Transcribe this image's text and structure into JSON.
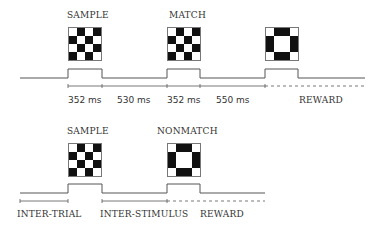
{
  "trial_match": {
    "labels": {
      "sample": "SAMPLE",
      "match": "MATCH"
    },
    "stimuli": {
      "sample_pattern": "checkerboard",
      "match_pattern": "checkerboard",
      "third_pattern": "ring"
    },
    "timeline": {
      "durations": [
        "352 ms",
        "530 ms",
        "352 ms",
        "550 ms"
      ],
      "reward": "REWARD"
    }
  },
  "trial_nonmatch": {
    "labels": {
      "sample": "SAMPLE",
      "nonmatch": "NONMATCH"
    },
    "stimuli": {
      "sample_pattern": "checkerboard",
      "nonmatch_pattern": "ring"
    },
    "timeline": {
      "inter_trial": "INTER-TRIAL",
      "inter_stimulus": "INTER-STIMULUS",
      "reward": "REWARD"
    }
  },
  "patterns": {
    "checkerboard": [
      [
        0,
        1,
        0,
        1
      ],
      [
        1,
        0,
        1,
        0
      ],
      [
        0,
        1,
        0,
        1
      ],
      [
        1,
        0,
        1,
        0
      ]
    ],
    "ring": [
      [
        0,
        1,
        1,
        0
      ],
      [
        1,
        0,
        0,
        1
      ],
      [
        1,
        0,
        0,
        1
      ],
      [
        0,
        1,
        1,
        0
      ]
    ]
  },
  "colors": {
    "ink": "#222222",
    "line": "#555555",
    "fill": "#111111"
  }
}
